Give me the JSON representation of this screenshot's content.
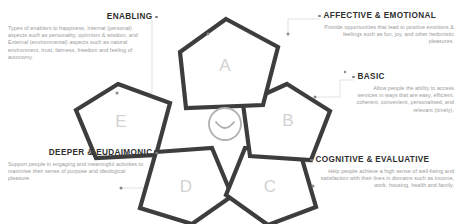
{
  "diagram": {
    "title_present": false,
    "stroke_color": "#3d3d3d",
    "letter_color": "#d2d2d2",
    "leader_color": "#cfcfcf",
    "dot_color": "#8a8a8a",
    "body_text_color": "#9a9a9a",
    "heading_color": "#2f2f2f",
    "center": {
      "name": "smiley-face",
      "circle_color": "#b0b0b0"
    },
    "pentagons": [
      {
        "id": "A",
        "label": "A"
      },
      {
        "id": "B",
        "label": "B"
      },
      {
        "id": "C",
        "label": "C"
      },
      {
        "id": "D",
        "label": "D"
      },
      {
        "id": "E",
        "label": "E"
      }
    ]
  },
  "callouts": {
    "enabling": {
      "heading": "ENABLING",
      "body": "Types of enablers to happiness, Internal (personal) aspects such as personality, optimism & wisdom, and External (environmental) aspects such as natural environment, trust, fairness, freedom and feeling of autonomy."
    },
    "affective": {
      "heading": "AFFECTIVE & EMOTIONAL",
      "body": "Provide opportunities that lead to positive emotions & feelings such as fun, joy, and other hedonistic pleasures."
    },
    "basic": {
      "heading": "BASIC",
      "body": "Allow people the ability to access services in ways that are easy, efficient, coherent, convenient, personalised, and relevant (timely)."
    },
    "deeper": {
      "heading": "DEEPER & EUDAIMONIC",
      "body": "Support people in engaging and meaningful activities to maximise their sense of purpose and ideological pleasure."
    },
    "cognitive": {
      "heading": "COGNITIVE & EVALUATIVE",
      "body": "Help people achieve a high sense of well-being and satisfaction with their lives in domains such as income, work, housing, health and family."
    }
  }
}
